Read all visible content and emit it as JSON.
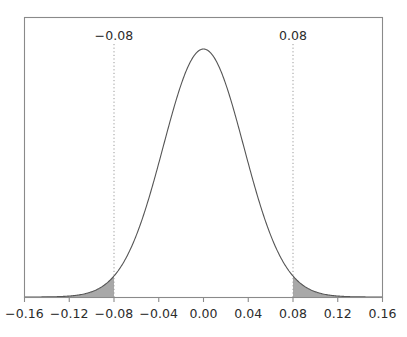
{
  "chart_data": {
    "type": "area",
    "title": "",
    "subtitle": "",
    "xlabel": "",
    "ylabel": "",
    "xlim": [
      -0.16,
      0.16
    ],
    "ylim": [
      0,
      11.5
    ],
    "grid": false,
    "legend": null,
    "distribution": {
      "kind": "normal",
      "mean": 0.0,
      "sigma": 0.036
    },
    "x_ticks": [
      -0.16,
      -0.12,
      -0.08,
      -0.04,
      0.0,
      0.04,
      0.08,
      0.12,
      0.16
    ],
    "x_tick_labels": [
      "−0.16",
      "−0.12",
      "−0.08",
      "−0.04",
      "0.00",
      "0.04",
      "0.08",
      "0.12",
      "0.16"
    ],
    "y_ticks": [],
    "y_tick_labels": [],
    "annotations": [
      {
        "name": "lower-critical-value",
        "label": "−0.08",
        "x": -0.08,
        "line_style": "dotted",
        "line_color": "#9a9a9a"
      },
      {
        "name": "upper-critical-value",
        "label": "0.08",
        "x": 0.08,
        "line_style": "dotted",
        "line_color": "#9a9a9a"
      }
    ],
    "shaded_regions": [
      {
        "name": "lower-tail",
        "from": -0.16,
        "to": -0.08,
        "fill": "#a8a8a8"
      },
      {
        "name": "upper-tail",
        "from": 0.08,
        "to": 0.16,
        "fill": "#a8a8a8"
      }
    ],
    "curve_color": "#555555",
    "frame_color": "#8a8a8a",
    "background": "#ffffff"
  }
}
